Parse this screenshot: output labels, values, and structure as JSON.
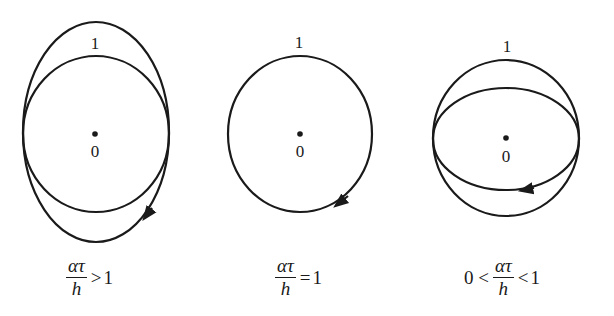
{
  "panels": [
    {
      "id": "greater",
      "point_one_label": "1",
      "origin_label": "0",
      "caption": {
        "prefix": "",
        "numerator": "ατ",
        "denominator": "h",
        "relation": ">",
        "value": "1"
      },
      "shapes": [
        "unit-circle",
        "vertical-ellipse"
      ]
    },
    {
      "id": "equal",
      "point_one_label": "1",
      "origin_label": "0",
      "caption": {
        "prefix": "",
        "numerator": "ατ",
        "denominator": "h",
        "relation": "=",
        "value": "1"
      },
      "shapes": [
        "unit-circle"
      ]
    },
    {
      "id": "between",
      "point_one_label": "1",
      "origin_label": "0",
      "caption": {
        "prefix": "0 <",
        "numerator": "ατ",
        "denominator": "h",
        "relation": "<",
        "value": "1"
      },
      "shapes": [
        "unit-circle",
        "horizontal-ellipse"
      ]
    }
  ],
  "colors": {
    "stroke": "#1a1a1a",
    "background": "#ffffff"
  }
}
